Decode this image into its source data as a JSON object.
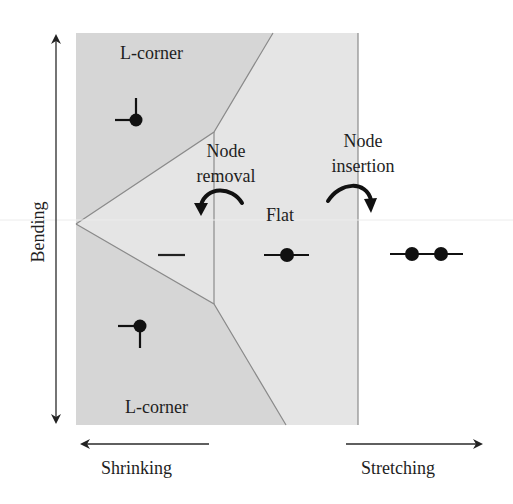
{
  "figure": {
    "axes": {
      "vertical_label": "Bending",
      "left_label": "Shrinking",
      "right_label": "Stretching"
    },
    "regions": {
      "top": "L-corner",
      "bottom": "L-corner",
      "middle": "Flat"
    },
    "operations": {
      "removal": "Node removal",
      "removal_line1": "Node",
      "removal_line2": "removal",
      "insertion": "Node insertion",
      "insertion_line1": "Node",
      "insertion_line2": "insertion"
    },
    "glyphs": [
      {
        "name": "top-l-corner-node",
        "description": "node with left and up edges"
      },
      {
        "name": "bottom-l-corner-node",
        "description": "node with left and down edges"
      },
      {
        "name": "removed-node-segment",
        "description": "segment without node"
      },
      {
        "name": "flat-node",
        "description": "single node on straight segment"
      },
      {
        "name": "stretched-nodes",
        "description": "two nodes on straight segment"
      }
    ],
    "colors": {
      "corner_region": "#d6d6d6",
      "flat_region": "#e5e5e5",
      "boundary": "#8a8a8a",
      "ink": "#111111",
      "background": "#ffffff"
    }
  }
}
